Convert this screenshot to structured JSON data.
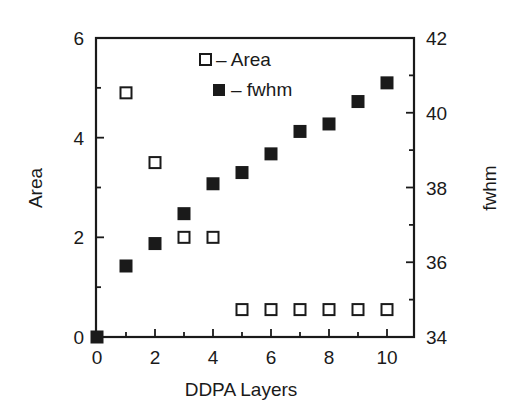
{
  "chart_data": {
    "type": "scatter",
    "title": "",
    "xlabel": "DDPA Layers",
    "ylabel": "Area",
    "ylabel_right": "fwhm",
    "xlim": [
      0,
      11
    ],
    "ylim": [
      0,
      6
    ],
    "ylim_right": [
      34,
      42
    ],
    "x_ticks": [
      0,
      2,
      4,
      6,
      8,
      10
    ],
    "y_ticks": [
      0,
      2,
      4,
      6
    ],
    "y_ticks_right": [
      34,
      36,
      38,
      40,
      42
    ],
    "grid": false,
    "legend_position": "upper center (inside)",
    "series": [
      {
        "name": "Area",
        "marker": "open-square",
        "axis": "left",
        "x": [
          1,
          2,
          3,
          4,
          5,
          6,
          7,
          8,
          9,
          10
        ],
        "values": [
          4.9,
          3.5,
          2.0,
          2.0,
          0.55,
          0.55,
          0.55,
          0.55,
          0.55,
          0.55
        ]
      },
      {
        "name": "fwhm",
        "marker": "filled-square",
        "axis": "right",
        "x": [
          0,
          1,
          2,
          3,
          4,
          5,
          6,
          7,
          8,
          9,
          10
        ],
        "values": [
          34.0,
          35.9,
          36.5,
          37.3,
          38.1,
          38.4,
          38.9,
          39.5,
          39.7,
          40.3,
          40.8
        ]
      }
    ]
  },
  "legend": [
    {
      "label": "– Area",
      "marker": "open-square"
    },
    {
      "label": "– fwhm",
      "marker": "filled-square"
    }
  ],
  "colors": {
    "ink": "#1a1a1a",
    "background": "#ffffff"
  }
}
